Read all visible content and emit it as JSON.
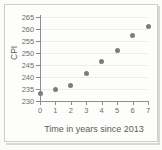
{
  "chart_data": {
    "type": "scatter",
    "title": "",
    "xlabel": "Time in years since 2013",
    "ylabel": "CPI",
    "x": [
      0,
      1,
      2,
      3,
      4,
      5,
      6,
      7
    ],
    "values": [
      233,
      235,
      236.5,
      241.5,
      246.5,
      251,
      257.5,
      261
    ],
    "xticks": [
      "0",
      "1",
      "2",
      "3",
      "4",
      "5",
      "6",
      "7"
    ],
    "yticks": [
      "230",
      "235",
      "240",
      "245",
      "250",
      "255",
      "260",
      "265"
    ],
    "xlim": [
      0,
      7
    ],
    "ylim": [
      230,
      265
    ],
    "grid": "horizontal",
    "legend": "none",
    "marker_color": "#7d7d7d",
    "axis_color": "#8e8e8e",
    "grid_color": "#ececea",
    "background_color": "#fdfdfb"
  }
}
